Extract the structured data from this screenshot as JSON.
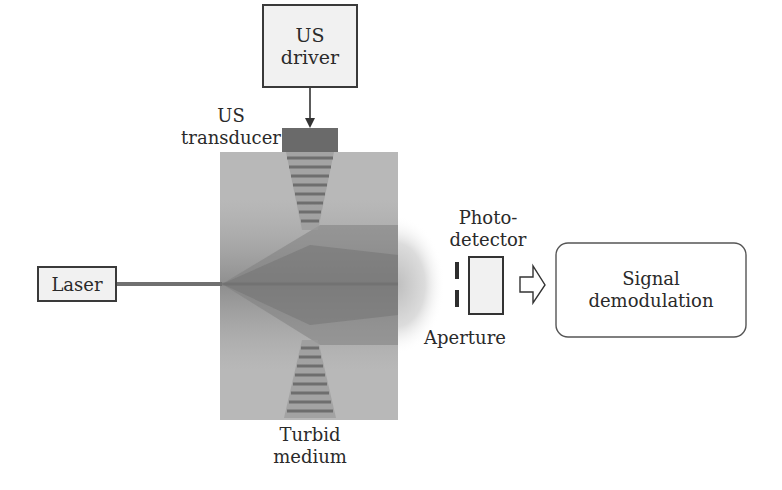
{
  "diagram": {
    "nodes": {
      "us_driver": {
        "label": "US driver"
      },
      "us_transducer": {
        "label_line1": "US",
        "label_line2": "transducer"
      },
      "laser": {
        "label": "Laser"
      },
      "turbid_medium": {
        "label_line1": "Turbid",
        "label_line2": "medium"
      },
      "photodetector": {
        "label_line1": "Photo-",
        "label_line2": "detector"
      },
      "aperture": {
        "label": "Aperture"
      },
      "signal_demodulation": {
        "label_line1": "Signal",
        "label_line2": "demodulation"
      }
    },
    "edges": [
      {
        "from": "US driver",
        "to": "US transducer",
        "type": "arrow"
      },
      {
        "from": "Laser",
        "to": "Turbid medium",
        "type": "beam"
      },
      {
        "from": "Photodetector",
        "to": "Signal demodulation",
        "type": "hollow-arrow"
      }
    ],
    "colors": {
      "border": "#3a3a3a",
      "box_fill": "#f1f1f1",
      "transducer": "#6a6a6a",
      "medium_light": "#b9b9b9",
      "medium_dark": "#7d7d7d",
      "beam": "#707070"
    }
  }
}
